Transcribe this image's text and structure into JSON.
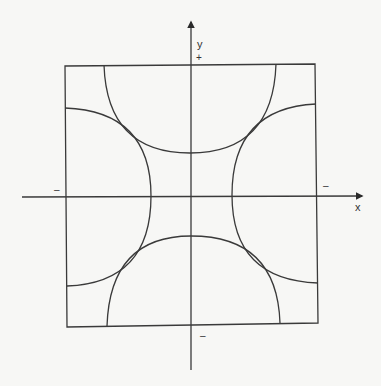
{
  "diagram": {
    "labels": {
      "y_axis": "y",
      "x_axis": "x",
      "top_sign": "+",
      "bottom_sign": "–",
      "left_sign": "–",
      "right_sign": "–"
    },
    "colors": {
      "stroke": "#3a3a3a",
      "background": "#f7f7f5",
      "text": "#333333"
    },
    "geometry": {
      "origin": [
        191,
        196
      ],
      "square": {
        "tl": [
          65,
          66
        ],
        "tr": [
          315,
          64
        ],
        "br": [
          318,
          323
        ],
        "bl": [
          67,
          327
        ]
      },
      "x_axis": {
        "from": [
          22,
          197
        ],
        "to": [
          362,
          196
        ]
      },
      "y_axis": {
        "from": [
          191,
          370
        ],
        "to": [
          191,
          22
        ]
      },
      "arcs": {
        "top": {
          "start": [
            104,
            65
          ],
          "apex": [
            190,
            153
          ],
          "end": [
            276,
            64
          ]
        },
        "bottom": {
          "start": [
            107,
            326
          ],
          "apex": [
            191,
            236
          ],
          "end": [
            280,
            323
          ]
        },
        "left": {
          "start": [
            65,
            108
          ],
          "apex": [
            151,
            196
          ],
          "end": [
            67,
            286
          ]
        },
        "right": {
          "start": [
            316,
            104
          ],
          "apex": [
            232,
            195
          ],
          "end": [
            318,
            283
          ]
        }
      }
    }
  }
}
